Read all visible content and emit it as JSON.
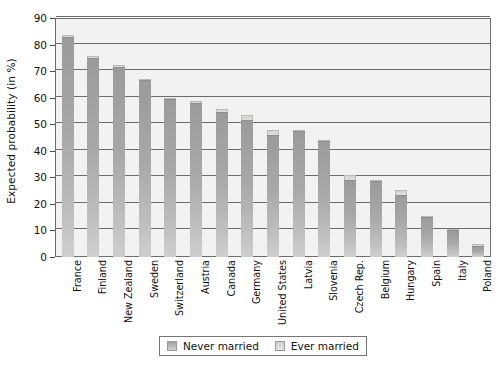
{
  "chart_data": {
    "type": "bar",
    "subtype": "stacked-bar",
    "title": "",
    "xlabel": "",
    "ylabel": "Expected probability (in %)",
    "ylim": [
      0,
      90
    ],
    "ytick_step": 10,
    "yticks": [
      0,
      10,
      20,
      30,
      40,
      50,
      60,
      70,
      80,
      90
    ],
    "grid": true,
    "legend_position": "bottom-center",
    "categories": [
      "France",
      "Finland",
      "New Zealand",
      "Sweden",
      "Switzerland",
      "Austria",
      "Canada",
      "Germany",
      "United States",
      "Latvia",
      "Slovenia",
      "Czech Rep.",
      "Belgium",
      "Hungary",
      "Spain",
      "Italy",
      "Poland"
    ],
    "series": [
      {
        "name": "Never married",
        "color": "#a8a8a8",
        "values": [
          83.0,
          74.8,
          71.5,
          66.5,
          59.5,
          58.0,
          54.5,
          51.5,
          46.0,
          47.5,
          43.5,
          29.0,
          28.5,
          23.5,
          15.0,
          10.0,
          4.0
        ]
      },
      {
        "name": "Ever married",
        "color": "#d8d8d6",
        "values": [
          0.5,
          0.8,
          0.8,
          0.5,
          0.5,
          0.8,
          1.2,
          1.8,
          1.8,
          0.5,
          0.5,
          1.8,
          0.5,
          1.8,
          0.4,
          0.4,
          1.0
        ]
      }
    ],
    "totals": [
      83.5,
      75.6,
      72.3,
      67.0,
      60.0,
      58.8,
      55.7,
      53.3,
      47.8,
      48.0,
      44.0,
      30.8,
      29.0,
      25.3,
      15.4,
      10.4,
      5.0
    ]
  },
  "legend": {
    "items": [
      {
        "label": "Never married",
        "swatch": "never-married-swatch"
      },
      {
        "label": "Ever married",
        "swatch": "ever-married-swatch"
      }
    ]
  }
}
